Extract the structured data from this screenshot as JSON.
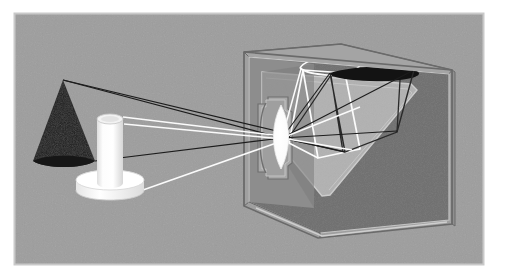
{
  "figure": {
    "kind": "optics-diagram",
    "canvas": {
      "width": 513,
      "height": 279
    },
    "background_color": "#ffffff"
  },
  "panel": {
    "x": 14,
    "y": 13,
    "width": 470,
    "height": 252,
    "fill_color": "#9d9d9d",
    "border_color": "#c9c9c9",
    "border_width": 2
  },
  "colors": {
    "scene_gray": "#9d9d9d",
    "panel_border": "#c9c9c9",
    "object_black": "#1a1a1a",
    "object_white": "#fefefe",
    "object_white_shade": "#e2e2e2",
    "object_white_dim": "#d2d2d2",
    "box_wall_light": "#a8a8a8",
    "box_wall_mid": "#9a9a9a",
    "box_interior_dark": "#6e6e6e",
    "box_interior_darker": "#636363",
    "screen_plane": "#b0b0b0",
    "edge_line": "#6a6a6a",
    "edge_line_light": "#c4c4c4",
    "ray_black": "#1c1c1c",
    "ray_white": "#fbfbfb"
  },
  "objects": [
    {
      "id": "cone",
      "name": "dark-cone-object",
      "label": "Cone (dark object)",
      "apex": {
        "x": 63,
        "y": 80
      },
      "base_center": {
        "x": 64,
        "y": 162
      },
      "base_radius_x": 31,
      "base_radius_y": 7,
      "fill": "#1a1a1a"
    },
    {
      "id": "cylinder",
      "name": "white-cylinder-object",
      "label": "Cylinder on disc (light object)",
      "top_center": {
        "x": 110,
        "y": 119
      },
      "bottom_center": {
        "x": 110,
        "y": 183
      },
      "radius_x": 13,
      "radius_y": 5,
      "fill": "#fefefe"
    },
    {
      "id": "disc",
      "name": "white-disc-base",
      "label": "Disc base",
      "top_center": {
        "x": 110,
        "y": 180
      },
      "radius_x": 34,
      "radius_y": 10,
      "thickness": 13,
      "fill": "#fefefe"
    }
  ],
  "lens": {
    "name": "convex-lens",
    "label": "Converging lens",
    "center": {
      "x": 281,
      "y": 137
    },
    "radius_x": 10,
    "radius_y": 32,
    "fill": "#fefefe",
    "housing_fill": "#a8a8a8",
    "housing_edge": "#787878"
  },
  "focal_point": {
    "x": 282,
    "y": 138
  },
  "rays": {
    "from_cone": {
      "name": "cone-light-rays",
      "color": "#1c1c1c",
      "label": "Rays from cone",
      "paths": [
        {
          "from": {
            "x": 63,
            "y": 80
          },
          "to": {
            "x": 282,
            "y": 138
          },
          "to_image": {
            "x": 393,
            "y": 71
          }
        },
        {
          "from": {
            "x": 94,
            "y": 161
          },
          "to": {
            "x": 282,
            "y": 138
          },
          "to_image": {
            "x": 331,
            "y": 72
          }
        },
        {
          "from": {
            "x": 63,
            "y": 80
          },
          "to": {
            "x": 282,
            "y": 138
          },
          "to_image": {
            "x": 343,
            "y": 152
          }
        }
      ]
    },
    "from_cylinder": {
      "name": "cylinder-light-rays",
      "color": "#fbfbfb",
      "label": "Rays from cylinder",
      "paths": [
        {
          "from": {
            "x": 110,
            "y": 118
          },
          "to": {
            "x": 282,
            "y": 138
          },
          "to_image": {
            "x": 354,
            "y": 106
          }
        },
        {
          "from": {
            "x": 140,
            "y": 190
          },
          "to": {
            "x": 282,
            "y": 138
          },
          "to_image": {
            "x": 300,
            "y": 58
          }
        },
        {
          "from": {
            "x": 110,
            "y": 118
          },
          "to": {
            "x": 282,
            "y": 138
          },
          "to_image": {
            "x": 348,
            "y": 158
          }
        }
      ]
    }
  },
  "box": {
    "name": "camera-obscura-box",
    "label": "Camera box (cutaway)",
    "front_wall_outline": "M244,52 L452,70 L452,224 L318,238 L244,206 Z",
    "interior_screen_label": "Projection screen plane",
    "interior_dark_label": "Box interior"
  },
  "projections": [
    {
      "id": "cone-image",
      "name": "inverted-cone-image",
      "label": "Inverted image of cone",
      "fill": "#121212",
      "inverted": true
    },
    {
      "id": "cylinder-image",
      "name": "inverted-cylinder-image",
      "label": "Inverted image of cylinder and disc",
      "stroke": "#fbfbfb",
      "inverted": true
    }
  ],
  "annotations": {
    "caption": "",
    "title": ""
  }
}
